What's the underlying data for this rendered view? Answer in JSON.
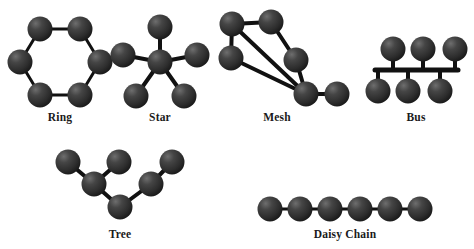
{
  "figure": {
    "background_color": "#ffffff",
    "node_color": "#2f2f2f",
    "node_highlight_color": "#6e6e6e",
    "edge_color": "#111111",
    "label_color": "#1a1a1a"
  },
  "topologies": [
    {
      "id": "ring",
      "label": "Ring",
      "label_x": 60,
      "label_y": 121,
      "node_radius": 12.5,
      "edge_width": 3,
      "nodes": [
        {
          "name": "ring-node-top-left",
          "x": 40,
          "y": 29
        },
        {
          "name": "ring-node-top-right",
          "x": 80,
          "y": 29
        },
        {
          "name": "ring-node-right",
          "x": 100,
          "y": 62
        },
        {
          "name": "ring-node-bottom-right",
          "x": 80,
          "y": 95
        },
        {
          "name": "ring-node-bottom-left",
          "x": 40,
          "y": 95
        },
        {
          "name": "ring-node-left",
          "x": 20,
          "y": 62
        }
      ],
      "edges": [
        [
          0,
          1
        ],
        [
          1,
          2
        ],
        [
          2,
          3
        ],
        [
          3,
          4
        ],
        [
          4,
          5
        ],
        [
          5,
          0
        ]
      ]
    },
    {
      "id": "star",
      "label": "Star",
      "label_x": 160,
      "label_y": 121,
      "node_radius": 12.5,
      "edge_width": 4,
      "nodes": [
        {
          "name": "star-node-center",
          "x": 160,
          "y": 62
        },
        {
          "name": "star-node-top",
          "x": 160,
          "y": 27
        },
        {
          "name": "star-node-left",
          "x": 123,
          "y": 55
        },
        {
          "name": "star-node-right",
          "x": 197,
          "y": 55
        },
        {
          "name": "star-node-bottom-left",
          "x": 136,
          "y": 96
        },
        {
          "name": "star-node-bottom-right",
          "x": 184,
          "y": 96
        }
      ],
      "edges": [
        [
          0,
          1
        ],
        [
          0,
          2
        ],
        [
          0,
          3
        ],
        [
          0,
          4
        ],
        [
          0,
          5
        ]
      ]
    },
    {
      "id": "mesh",
      "label": "Mesh",
      "label_x": 277,
      "label_y": 121,
      "node_radius": 12.5,
      "edge_width": 4,
      "nodes": [
        {
          "name": "mesh-node-top-left",
          "x": 232,
          "y": 24
        },
        {
          "name": "mesh-node-top-right",
          "x": 271,
          "y": 22
        },
        {
          "name": "mesh-node-mid-left",
          "x": 231,
          "y": 58
        },
        {
          "name": "mesh-node-mid-right",
          "x": 296,
          "y": 60
        },
        {
          "name": "mesh-node-hub",
          "x": 306,
          "y": 94
        },
        {
          "name": "mesh-node-right",
          "x": 337,
          "y": 94
        }
      ],
      "edges": [
        [
          0,
          1
        ],
        [
          0,
          2
        ],
        [
          0,
          4
        ],
        [
          1,
          3
        ],
        [
          2,
          4
        ],
        [
          3,
          4
        ],
        [
          4,
          5
        ]
      ]
    },
    {
      "id": "bus",
      "label": "Bus",
      "label_x": 416,
      "label_y": 121,
      "node_radius": 12.5,
      "edge_width": 4,
      "backbone": {
        "name": "bus-backbone",
        "x1": 375,
        "x2": 458,
        "y": 70,
        "width": 5
      },
      "nodes": [
        {
          "name": "bus-node-top-1",
          "x": 393,
          "y": 49
        },
        {
          "name": "bus-node-top-2",
          "x": 423,
          "y": 49
        },
        {
          "name": "bus-node-top-3",
          "x": 455,
          "y": 49
        },
        {
          "name": "bus-node-bottom-1",
          "x": 378,
          "y": 91
        },
        {
          "name": "bus-node-bottom-2",
          "x": 408,
          "y": 91
        },
        {
          "name": "bus-node-bottom-3",
          "x": 440,
          "y": 91
        }
      ],
      "stems": [
        {
          "x": 393,
          "y1": 49,
          "y2": 70
        },
        {
          "x": 423,
          "y1": 49,
          "y2": 70
        },
        {
          "x": 455,
          "y1": 49,
          "y2": 70
        },
        {
          "x": 378,
          "y1": 70,
          "y2": 91
        },
        {
          "x": 408,
          "y1": 70,
          "y2": 91
        },
        {
          "x": 440,
          "y1": 70,
          "y2": 91
        }
      ]
    },
    {
      "id": "tree",
      "label": "Tree",
      "label_x": 120,
      "label_y": 238,
      "node_radius": 12.5,
      "edge_width": 4,
      "nodes": [
        {
          "name": "tree-node-root",
          "x": 120,
          "y": 207
        },
        {
          "name": "tree-node-branch-left",
          "x": 94,
          "y": 184
        },
        {
          "name": "tree-node-branch-right",
          "x": 151,
          "y": 184
        },
        {
          "name": "tree-node-leaf-1",
          "x": 68,
          "y": 162
        },
        {
          "name": "tree-node-leaf-2",
          "x": 119,
          "y": 162
        },
        {
          "name": "tree-node-leaf-3",
          "x": 172,
          "y": 162
        }
      ],
      "edges": [
        [
          0,
          1
        ],
        [
          0,
          2
        ],
        [
          1,
          3
        ],
        [
          1,
          4
        ],
        [
          2,
          5
        ]
      ]
    },
    {
      "id": "daisy-chain",
      "label": "Daisy Chain",
      "label_x": 345,
      "label_y": 238,
      "node_radius": 12.5,
      "edge_width": 3,
      "nodes": [
        {
          "name": "daisy-node-1",
          "x": 270,
          "y": 209
        },
        {
          "name": "daisy-node-2",
          "x": 300,
          "y": 209
        },
        {
          "name": "daisy-node-3",
          "x": 330,
          "y": 209
        },
        {
          "name": "daisy-node-4",
          "x": 360,
          "y": 209
        },
        {
          "name": "daisy-node-5",
          "x": 390,
          "y": 209
        },
        {
          "name": "daisy-node-6",
          "x": 420,
          "y": 209
        }
      ],
      "edges": [
        [
          0,
          1
        ],
        [
          1,
          2
        ],
        [
          2,
          3
        ],
        [
          3,
          4
        ],
        [
          4,
          5
        ]
      ]
    }
  ]
}
